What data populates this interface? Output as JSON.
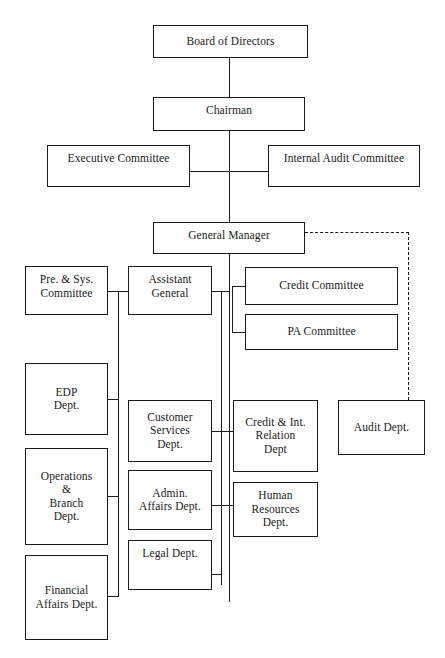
{
  "chart": {
    "type": "organization-chart",
    "title": "",
    "nodes": [
      {
        "id": "board",
        "label": "Board of Directors",
        "x": 153,
        "y": 25,
        "w": 155,
        "h": 33,
        "align": "center"
      },
      {
        "id": "chairman",
        "label": "Chairman",
        "x": 153,
        "y": 97,
        "w": 152,
        "h": 34,
        "align": "top"
      },
      {
        "id": "exec",
        "label": "Executive Committee",
        "x": 47,
        "y": 145,
        "w": 143,
        "h": 42,
        "align": "top"
      },
      {
        "id": "audit-cmte",
        "label": "Internal Audit Committee",
        "x": 268,
        "y": 145,
        "w": 152,
        "h": 42,
        "align": "top"
      },
      {
        "id": "gm",
        "label": "General Manager",
        "x": 153,
        "y": 222,
        "w": 152,
        "h": 32,
        "align": "top"
      },
      {
        "id": "presys",
        "label": "Pre. & Sys.\nCommittee",
        "x": 25,
        "y": 266,
        "w": 83,
        "h": 49,
        "align": "top"
      },
      {
        "id": "asstgen",
        "label": "Assistant\nGeneral",
        "x": 128,
        "y": 266,
        "w": 84,
        "h": 49,
        "align": "top"
      },
      {
        "id": "credit-c",
        "label": "Credit Committee",
        "x": 245,
        "y": 267,
        "w": 153,
        "h": 38,
        "align": "center"
      },
      {
        "id": "pa-c",
        "label": "PA Committee",
        "x": 245,
        "y": 314,
        "w": 153,
        "h": 36,
        "align": "center"
      },
      {
        "id": "edp",
        "label": "EDP\nDept.",
        "x": 25,
        "y": 363,
        "w": 83,
        "h": 72,
        "align": "center"
      },
      {
        "id": "cust",
        "label": "Customer\nServices\nDept.",
        "x": 128,
        "y": 400,
        "w": 84,
        "h": 62,
        "align": "center"
      },
      {
        "id": "creditint",
        "label": "Credit & Int.\nRelation\nDept",
        "x": 233,
        "y": 400,
        "w": 85,
        "h": 72,
        "align": "center"
      },
      {
        "id": "auditdept",
        "label": "Audit Dept.",
        "x": 338,
        "y": 400,
        "w": 87,
        "h": 55,
        "align": "center"
      },
      {
        "id": "ops",
        "label": "Operations\n&\nBranch\nDept.",
        "x": 25,
        "y": 448,
        "w": 83,
        "h": 97,
        "align": "center"
      },
      {
        "id": "admin",
        "label": "Admin.\nAffairs Dept.",
        "x": 128,
        "y": 470,
        "w": 84,
        "h": 60,
        "align": "center"
      },
      {
        "id": "hr",
        "label": "Human\nResources\nDept.",
        "x": 233,
        "y": 482,
        "w": 85,
        "h": 55,
        "align": "center"
      },
      {
        "id": "legal",
        "label": "Legal Dept.",
        "x": 128,
        "y": 540,
        "w": 84,
        "h": 50,
        "align": "top"
      },
      {
        "id": "financial",
        "label": "Financial\nAffairs Dept.",
        "x": 25,
        "y": 555,
        "w": 83,
        "h": 85,
        "align": "center"
      }
    ],
    "connectors": [
      {
        "name": "board-to-chairman",
        "orient": "v",
        "x": 229,
        "y": 58,
        "len": 39
      },
      {
        "name": "chairman-to-spine",
        "orient": "v",
        "x": 229,
        "y": 131,
        "len": 91
      },
      {
        "name": "exec-to-spine",
        "orient": "h",
        "x": 190,
        "y": 171,
        "len": 40
      },
      {
        "name": "auditcmte-to-spine",
        "orient": "h",
        "x": 229,
        "y": 171,
        "len": 39
      },
      {
        "name": "gm-to-lower-spine",
        "orient": "v",
        "x": 229,
        "y": 254,
        "len": 348
      },
      {
        "name": "asstgen-to-spine",
        "orient": "h",
        "x": 212,
        "y": 291,
        "len": 18
      },
      {
        "name": "presys-to-asstgen",
        "orient": "h",
        "x": 108,
        "y": 291,
        "len": 20
      },
      {
        "name": "committee-riser",
        "orient": "v",
        "x": 232,
        "y": 286,
        "len": 47
      },
      {
        "name": "credit-cmte-stub",
        "orient": "h",
        "x": 232,
        "y": 286,
        "len": 14
      },
      {
        "name": "pa-cmte-stub",
        "orient": "h",
        "x": 232,
        "y": 332,
        "len": 14
      },
      {
        "name": "asstgen-drop",
        "orient": "v",
        "x": 221,
        "y": 291,
        "len": 294
      },
      {
        "name": "cust-to-spine",
        "orient": "h",
        "x": 212,
        "y": 431,
        "len": 10
      },
      {
        "name": "creditint-to-spine",
        "orient": "h",
        "x": 222,
        "y": 431,
        "len": 12
      },
      {
        "name": "admin-to-spine",
        "orient": "h",
        "x": 212,
        "y": 505,
        "len": 10
      },
      {
        "name": "hr-to-spine",
        "orient": "h",
        "x": 222,
        "y": 505,
        "len": 12
      },
      {
        "name": "legal-to-spine",
        "orient": "h",
        "x": 212,
        "y": 574,
        "len": 10
      },
      {
        "name": "left-spine",
        "orient": "v",
        "x": 118,
        "y": 291,
        "len": 305
      },
      {
        "name": "edp-to-left-spine",
        "orient": "h",
        "x": 108,
        "y": 399,
        "len": 11
      },
      {
        "name": "ops-to-left-spine",
        "orient": "h",
        "x": 108,
        "y": 496,
        "len": 11
      },
      {
        "name": "financial-to-left-spine",
        "orient": "h",
        "x": 108,
        "y": 596,
        "len": 11
      }
    ],
    "dashed_connectors": [
      {
        "name": "gm-to-audit-dept-horizontal",
        "orient": "h",
        "x": 305,
        "y": 232,
        "len": 104
      },
      {
        "name": "gm-to-audit-dept-vertical",
        "orient": "v",
        "x": 408,
        "y": 232,
        "len": 168
      }
    ]
  }
}
